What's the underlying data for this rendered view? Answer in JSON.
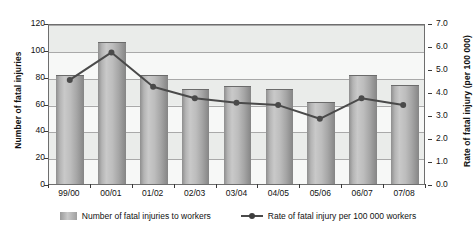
{
  "chart_data": {
    "type": "bar",
    "title": "",
    "xlabel": "",
    "categories": [
      "99/00",
      "00/01",
      "01/02",
      "02/03",
      "03/04",
      "04/05",
      "05/06",
      "06/07",
      "07/08"
    ],
    "grid": true,
    "legend_position": "bottom",
    "series": [
      {
        "name": "Number of fatal injuries to workers",
        "type": "bar",
        "axis": "left",
        "values": [
          81,
          106,
          81,
          71,
          73,
          71,
          61,
          81,
          74
        ],
        "color": "#b4b4b4"
      },
      {
        "name": "Rate of fatal injury per 100 000 workers",
        "type": "line",
        "axis": "right",
        "values": [
          4.6,
          5.8,
          4.3,
          3.8,
          3.6,
          3.5,
          2.9,
          3.8,
          3.5
        ],
        "color": "#4a4a4a"
      }
    ],
    "left_axis": {
      "label": "Number of fatal injuries",
      "ticks": [
        "0",
        "20",
        "40",
        "60",
        "80",
        "100",
        "120"
      ],
      "values": [
        0,
        20,
        40,
        60,
        80,
        100,
        120
      ],
      "ylim": [
        0,
        120
      ]
    },
    "right_axis": {
      "label": "Rate of fatal injury (per 100 000)",
      "ticks": [
        "0.0",
        "1.0",
        "2.0",
        "3.0",
        "4.0",
        "5.0",
        "6.0",
        "7.0"
      ],
      "values": [
        0,
        1,
        2,
        3,
        4,
        5,
        6,
        7
      ],
      "ylim": [
        0,
        7
      ]
    },
    "legend": [
      {
        "label": "Number of fatal injuries to workers",
        "marker": "bar-swatch"
      },
      {
        "label": "Rate of fatal injury per 100 000 workers",
        "marker": "line-marker"
      }
    ]
  },
  "colors": {
    "plot_background": "#eef0ef",
    "band_light": "#f7f8f7",
    "band_mid": "#eaecea",
    "gridline": "#a9a9a9",
    "axis_border": "#6e6e6e",
    "bar_fill": "#b4b4b4",
    "line": "#4a4a4a",
    "text": "#111111"
  }
}
